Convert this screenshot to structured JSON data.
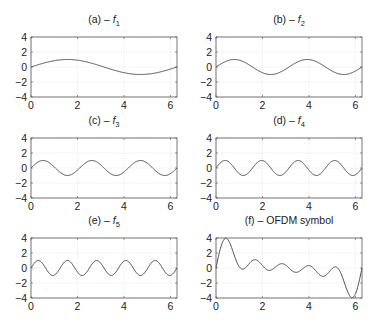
{
  "chart_data": [
    {
      "type": "line",
      "panel": "a",
      "title": "(a) – f1",
      "title_prefix": "(a) – ",
      "title_fn": "f",
      "title_sub": "1",
      "function": "sin(1x)",
      "k": 1,
      "xlim": [
        0,
        6.2832
      ],
      "ylim": [
        -4,
        4
      ],
      "xticks": [
        0,
        2,
        4,
        6
      ],
      "yticks": [
        4,
        2,
        0,
        -2,
        -4
      ],
      "grid": true,
      "x": [
        0,
        1.571,
        3.142,
        4.712,
        6.283
      ],
      "y": [
        0,
        1,
        0,
        -1,
        0
      ]
    },
    {
      "type": "line",
      "panel": "b",
      "title": "(b) – f2",
      "title_prefix": "(b) – ",
      "title_fn": "f",
      "title_sub": "2",
      "function": "sin(2x)",
      "k": 2,
      "xlim": [
        0,
        6.2832
      ],
      "ylim": [
        -4,
        4
      ],
      "xticks": [
        0,
        2,
        4,
        6
      ],
      "yticks": [
        4,
        2,
        0,
        -2,
        -4
      ],
      "grid": true,
      "x": [
        0,
        0.785,
        2.356,
        3.927,
        5.498,
        6.283
      ],
      "y": [
        0,
        1,
        -1,
        1,
        -1,
        0
      ]
    },
    {
      "type": "line",
      "panel": "c",
      "title": "(c) – f3",
      "title_prefix": "(c) – ",
      "title_fn": "f",
      "title_sub": "3",
      "function": "sin(3x)",
      "k": 3,
      "xlim": [
        0,
        6.2832
      ],
      "ylim": [
        -4,
        4
      ],
      "xticks": [
        0,
        2,
        4,
        6
      ],
      "yticks": [
        4,
        2,
        0,
        -2,
        -4
      ],
      "grid": true,
      "x": [
        0,
        0.524,
        1.571,
        2.618,
        3.665,
        4.712,
        5.76,
        6.283
      ],
      "y": [
        0,
        1,
        -1,
        1,
        -1,
        1,
        -1,
        0
      ]
    },
    {
      "type": "line",
      "panel": "d",
      "title": "(d) – f4",
      "title_prefix": "(d) – ",
      "title_fn": "f",
      "title_sub": "4",
      "function": "sin(4x)",
      "k": 4,
      "xlim": [
        0,
        6.2832
      ],
      "ylim": [
        -4,
        4
      ],
      "xticks": [
        0,
        2,
        4,
        6
      ],
      "yticks": [
        4,
        2,
        0,
        -2,
        -4
      ],
      "grid": true,
      "x": [
        0,
        0.393,
        1.178,
        1.963,
        2.749,
        3.534,
        4.32,
        5.105,
        5.89,
        6.283
      ],
      "y": [
        0,
        1,
        -1,
        1,
        -1,
        1,
        -1,
        1,
        -1,
        0
      ]
    },
    {
      "type": "line",
      "panel": "e",
      "title": "(e) – f5",
      "title_prefix": "(e) – ",
      "title_fn": "f",
      "title_sub": "5",
      "function": "sin(5x)",
      "k": 5,
      "xlim": [
        0,
        6.2832
      ],
      "ylim": [
        -4,
        4
      ],
      "xticks": [
        0,
        2,
        4,
        6
      ],
      "yticks": [
        4,
        2,
        0,
        -2,
        -4
      ],
      "grid": true,
      "x": [
        0,
        0.314,
        0.942,
        1.571,
        2.199,
        2.827,
        3.456,
        4.084,
        4.712,
        5.341,
        5.969,
        6.283
      ],
      "y": [
        0,
        1,
        -1,
        1,
        -1,
        1,
        -1,
        1,
        -1,
        1,
        -1,
        0
      ]
    },
    {
      "type": "line",
      "panel": "f",
      "title": "(f) – OFDM symbol",
      "title_prefix": "(f) – OFDM symbol",
      "title_fn": "",
      "title_sub": "",
      "function": "sum of sin(kx), k=1..5",
      "k": 0,
      "xlim": [
        0,
        6.2832
      ],
      "ylim": [
        -4,
        4
      ],
      "xticks": [
        0,
        2,
        4,
        6
      ],
      "yticks": [
        4,
        2,
        0,
        -2,
        -4
      ],
      "grid": true,
      "x": [
        0,
        0.45,
        1.1,
        1.65,
        2.25,
        2.85,
        3.45,
        4.0,
        4.6,
        5.15,
        5.85,
        6.283
      ],
      "y": [
        0,
        3.9,
        -0.1,
        1.2,
        -0.35,
        0.6,
        -0.6,
        0.35,
        -1.2,
        0.1,
        -3.9,
        0
      ]
    }
  ],
  "layout": {
    "cols_x": [
      31,
      216
    ],
    "plot_width": 146,
    "rows_y": [
      37,
      138,
      238
    ],
    "plot_height": 60
  },
  "colors": {
    "curve": "#3a3a3a",
    "frame": "#555555",
    "grid": "#d6d6d6",
    "text": "#222222"
  }
}
